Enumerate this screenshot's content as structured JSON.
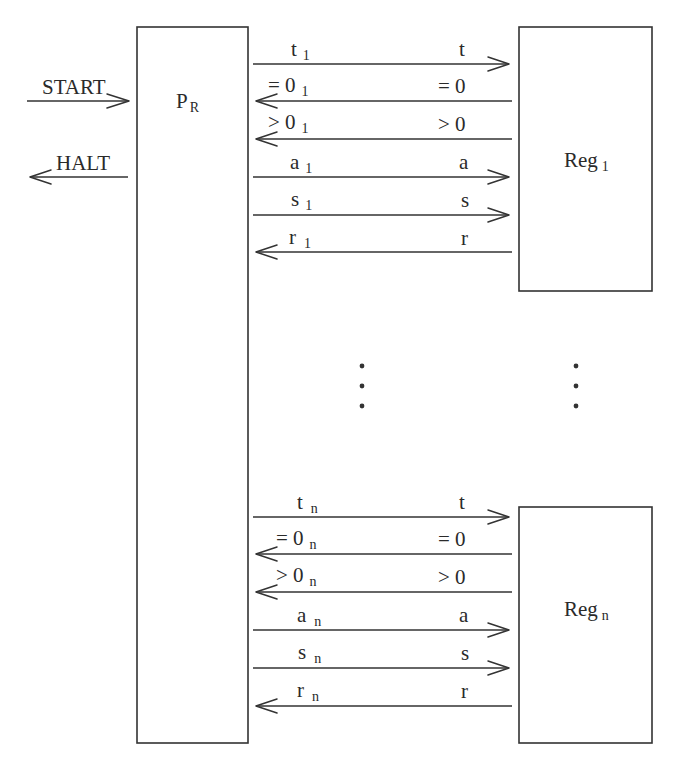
{
  "diagram": {
    "type": "block-diagram",
    "controller": {
      "label": "P",
      "subscript": "R"
    },
    "external_signals": [
      {
        "label": "START",
        "direction": "in"
      },
      {
        "label": "HALT",
        "direction": "out"
      }
    ],
    "ellipsis": "⋮",
    "registers": [
      {
        "label": "Reg",
        "subscript": "1",
        "signals": [
          {
            "left": "t",
            "left_sub": "1",
            "right": "t",
            "direction": "to-register"
          },
          {
            "left": "= 0",
            "left_sub": "1",
            "right": "= 0",
            "direction": "to-controller"
          },
          {
            "left": "> 0",
            "left_sub": "1",
            "right": "> 0",
            "direction": "to-controller"
          },
          {
            "left": "a",
            "left_sub": "1",
            "right": "a",
            "direction": "to-register"
          },
          {
            "left": "s",
            "left_sub": "1",
            "right": "s",
            "direction": "to-register"
          },
          {
            "left": "r",
            "left_sub": "1",
            "right": "r",
            "direction": "to-controller"
          }
        ]
      },
      {
        "label": "Reg",
        "subscript": "n",
        "signals": [
          {
            "left": "t",
            "left_sub": "n",
            "right": "t",
            "direction": "to-register"
          },
          {
            "left": "= 0",
            "left_sub": "n",
            "right": "= 0",
            "direction": "to-controller"
          },
          {
            "left": "> 0",
            "left_sub": "n",
            "right": "> 0",
            "direction": "to-controller"
          },
          {
            "left": "a",
            "left_sub": "n",
            "right": "a",
            "direction": "to-register"
          },
          {
            "left": "s",
            "left_sub": "n",
            "right": "s",
            "direction": "to-register"
          },
          {
            "left": "r",
            "left_sub": "n",
            "right": "r",
            "direction": "to-controller"
          }
        ]
      }
    ]
  }
}
